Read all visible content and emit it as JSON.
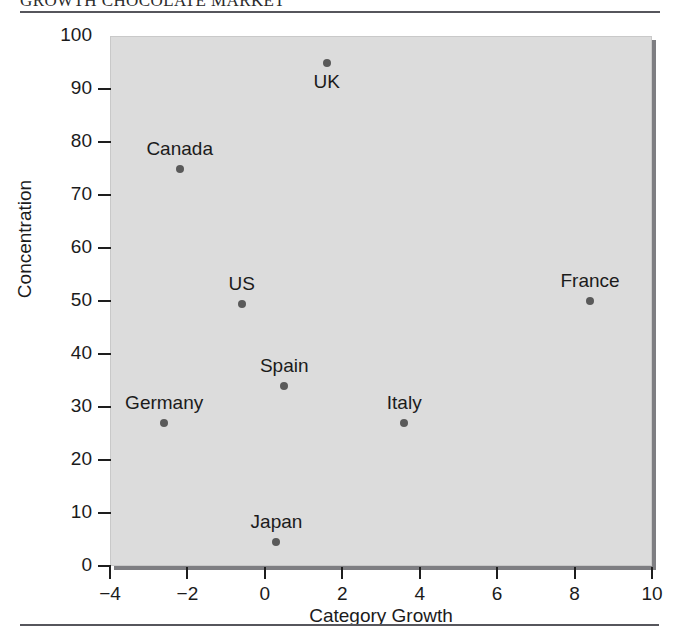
{
  "page": {
    "title": "GROWTH CHOCOLATE MARKET"
  },
  "chart_data": {
    "type": "scatter",
    "title": "GROWTH CHOCOLATE MARKET",
    "xlabel": "Category Growth",
    "ylabel": "Concentration",
    "xlim": [
      -4,
      10
    ],
    "ylim": [
      0,
      100
    ],
    "xticks": [
      -4,
      -2,
      0,
      2,
      4,
      6,
      8,
      10
    ],
    "xtick_labels": [
      "−4",
      "−2",
      "0",
      "2",
      "4",
      "6",
      "8",
      "10"
    ],
    "yticks": [
      0,
      10,
      20,
      30,
      40,
      50,
      60,
      70,
      80,
      90,
      100
    ],
    "ytick_labels": [
      "0",
      "10",
      "20",
      "30",
      "40",
      "50",
      "60",
      "70",
      "80",
      "90",
      "100"
    ],
    "grid": false,
    "legend": "none",
    "marker_color": "#5a5a5a",
    "plot_background": "#dcdcdc",
    "points": [
      {
        "label": "UK",
        "x": 1.6,
        "y": 95.0,
        "label_pos": "below"
      },
      {
        "label": "Canada",
        "x": -2.2,
        "y": 75.0,
        "label_pos": "above"
      },
      {
        "label": "US",
        "x": -0.6,
        "y": 49.5,
        "label_pos": "above"
      },
      {
        "label": "France",
        "x": 8.4,
        "y": 50.0,
        "label_pos": "above"
      },
      {
        "label": "Spain",
        "x": 0.5,
        "y": 34.0,
        "label_pos": "above"
      },
      {
        "label": "Germany",
        "x": -2.6,
        "y": 27.0,
        "label_pos": "above"
      },
      {
        "label": "Italy",
        "x": 3.6,
        "y": 27.0,
        "label_pos": "above"
      },
      {
        "label": "Japan",
        "x": 0.3,
        "y": 4.5,
        "label_pos": "above"
      }
    ]
  }
}
